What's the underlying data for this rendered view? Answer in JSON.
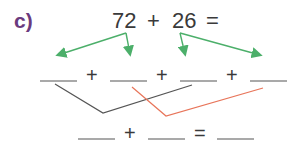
{
  "problem": {
    "label": "c)",
    "number_a": "72",
    "operator": "+",
    "number_b": "26",
    "equals": "="
  },
  "partition_row": {
    "blanks": 4,
    "operators": [
      "+",
      "+",
      "+"
    ]
  },
  "result_row": {
    "blanks": 3,
    "operators": [
      "+",
      "="
    ]
  },
  "colors": {
    "label": "#6b3a7e",
    "text": "#3a3a3a",
    "partition_arrows": "#4caf6a",
    "tens_link": "#555555",
    "ones_link": "#e8755a",
    "blank_line": "#555555"
  }
}
